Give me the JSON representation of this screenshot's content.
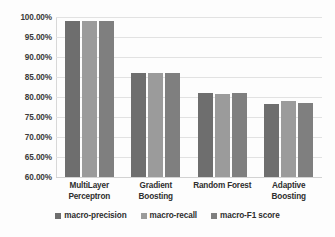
{
  "chart_data": {
    "type": "bar",
    "title": "",
    "xlabel": "",
    "ylabel": "",
    "ylim": [
      60,
      100
    ],
    "ytick_step": 5,
    "grid": true,
    "legend_position": "bottom",
    "ytick_labels": [
      "100.00%",
      "95.00%",
      "90.00%",
      "85.00%",
      "80.00%",
      "75.00%",
      "70.00%",
      "65.00%",
      "60.00%"
    ],
    "ytick_values": [
      100,
      95,
      90,
      85,
      80,
      75,
      70,
      65,
      60
    ],
    "categories": [
      "MultiLayer\nPerceptron",
      "Gradient Boosting",
      "Random Forest",
      "Adaptive\nBoosting"
    ],
    "series": [
      {
        "name": "macro-precision",
        "color": "#6e6e6e",
        "values": [
          99.1,
          86.0,
          81.0,
          78.3
        ]
      },
      {
        "name": "macro-recall",
        "color": "#9b9b9b",
        "values": [
          99.0,
          86.0,
          80.7,
          79.0
        ]
      },
      {
        "name": "macro-F1 score",
        "color": "#7f7f7f",
        "values": [
          98.9,
          86.1,
          80.9,
          78.6
        ]
      }
    ]
  }
}
